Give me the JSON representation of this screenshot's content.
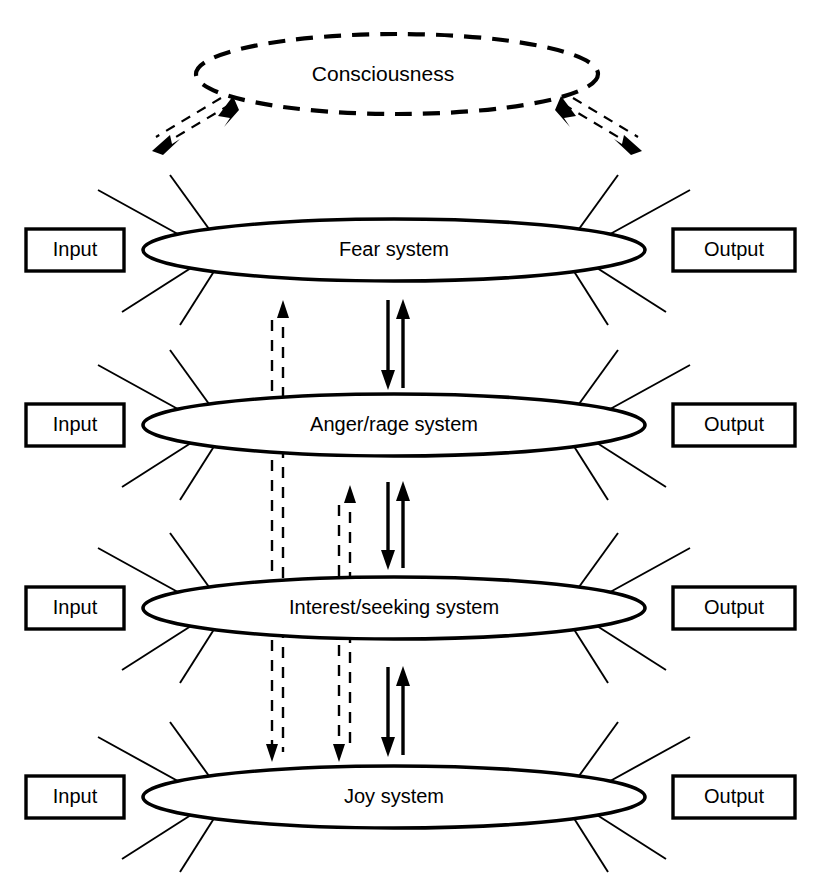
{
  "figure": {
    "title_node": "Consciousness",
    "background_color": "#ffffff",
    "line_color": "#000000"
  },
  "consciousness": {
    "label": "Consciousness",
    "shape": "dashed-ellipse",
    "cx": 397,
    "cy": 74,
    "rx": 201,
    "ry": 40
  },
  "systems": [
    {
      "id": "fear",
      "label": "Fear system",
      "input_label": "Input",
      "output_label": "Output",
      "cy": 250
    },
    {
      "id": "anger-rage",
      "label": "Anger/rage system",
      "input_label": "Input",
      "output_label": "Output",
      "cy": 425
    },
    {
      "id": "interest-seeking",
      "label": "Interest/seeking system",
      "input_label": "Input",
      "output_label": "Output",
      "cy": 608
    },
    {
      "id": "joy",
      "label": "Joy system",
      "input_label": "Input",
      "output_label": "Output",
      "cy": 797
    }
  ],
  "connections": {
    "consciousness_links": [
      {
        "name": "consciousness-left-link",
        "style": "double-headed-dashed",
        "direction": "bidirectional"
      },
      {
        "name": "consciousness-right-link",
        "style": "double-headed-dashed",
        "direction": "bidirectional"
      }
    ],
    "inter_system": [
      {
        "name": "fear-anger-solid-pair",
        "style": "solid",
        "direction": "bidirectional"
      },
      {
        "name": "anger-interest-solid-pair",
        "style": "solid",
        "direction": "bidirectional"
      },
      {
        "name": "interest-joy-solid-pair",
        "style": "solid",
        "direction": "bidirectional"
      }
    ],
    "long_dashed": [
      {
        "name": "joy-to-fear-dashed",
        "style": "dashed",
        "direction": "bidirectional"
      },
      {
        "name": "joy-to-anger-dashed",
        "style": "dashed",
        "direction": "bidirectional"
      }
    ]
  },
  "geometry": {
    "ellipse_rx": 251,
    "ellipse_ry": 31,
    "ellipse_cx": 394,
    "input_box": {
      "x": 26,
      "width": 98,
      "height": 42
    },
    "output_box": {
      "x": 673,
      "width": 122,
      "height": 42
    }
  }
}
